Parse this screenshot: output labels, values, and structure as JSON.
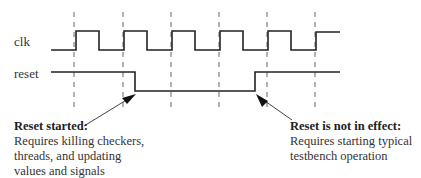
{
  "signals": {
    "clk": {
      "label": "clk"
    },
    "reset": {
      "label": "reset"
    }
  },
  "annotations": {
    "reset_started": {
      "title": "Reset started:",
      "lines": [
        "Requires killing checkers,",
        "threads, and updating",
        "values and signals"
      ]
    },
    "reset_not_in_effect": {
      "title": "Reset is not in effect:",
      "lines": [
        "Requires starting typical",
        "testbench operation"
      ]
    }
  },
  "colors": {
    "line": "#222222",
    "dash": "#555555",
    "text": "#333333"
  }
}
